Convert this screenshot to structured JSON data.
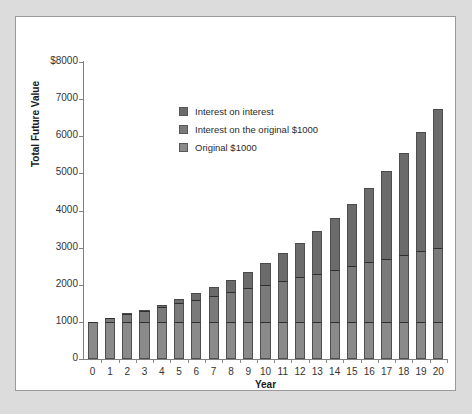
{
  "figure": {
    "background_color": "#dcdcdc",
    "panel_color": "#ffffff",
    "panel_border_color": "#9a9a9a"
  },
  "legend": {
    "position": "inside-top-left",
    "items": [
      {
        "label": "Interest on interest",
        "color": "#6b6b6b",
        "swatch_name": "legend-swatch-interest-on-interest"
      },
      {
        "label": "Interest on the original $1000",
        "color": "#7a7a7a",
        "swatch_name": "legend-swatch-interest-on-original"
      },
      {
        "label": "Original $1000",
        "color": "#8a8a8a",
        "swatch_name": "legend-swatch-original"
      }
    ]
  },
  "chart_data": {
    "type": "bar",
    "stacked": true,
    "title": "",
    "subtitle": "",
    "xlabel": "Year",
    "ylabel": "Total Future Value",
    "grid": false,
    "ylim": [
      0,
      8000
    ],
    "ytick_values": [
      0,
      1000,
      2000,
      3000,
      4000,
      5000,
      6000,
      7000,
      8000
    ],
    "ytick_labels": [
      "0",
      "1000",
      "2000",
      "3000",
      "4000",
      "5000",
      "6000",
      "7000",
      "$8000"
    ],
    "categories": [
      "0",
      "1",
      "2",
      "3",
      "4",
      "5",
      "6",
      "7",
      "8",
      "9",
      "10",
      "11",
      "12",
      "13",
      "14",
      "15",
      "16",
      "17",
      "18",
      "19",
      "20"
    ],
    "xtick_labels": [
      "0",
      "1",
      "2",
      "3",
      "4",
      "5",
      "6",
      "7",
      "8",
      "9",
      "10",
      "11",
      "12",
      "13",
      "14",
      "15",
      "16",
      "17",
      "18",
      "19",
      "20"
    ],
    "series": [
      {
        "name": "Original $1000",
        "color": "#8a8a8a",
        "values": [
          1000,
          1000,
          1000,
          1000,
          1000,
          1000,
          1000,
          1000,
          1000,
          1000,
          1000,
          1000,
          1000,
          1000,
          1000,
          1000,
          1000,
          1000,
          1000,
          1000,
          1000
        ]
      },
      {
        "name": "Interest on the original $1000",
        "color": "#7a7a7a",
        "values": [
          0,
          100,
          200,
          300,
          400,
          500,
          600,
          700,
          800,
          900,
          1000,
          1100,
          1200,
          1300,
          1400,
          1500,
          1600,
          1700,
          1800,
          1900,
          2000
        ]
      },
      {
        "name": "Interest on interest",
        "color": "#6b6b6b",
        "values": [
          0,
          0,
          10,
          31,
          64,
          105,
          172,
          249,
          336,
          436,
          594,
          753,
          938,
          1152,
          1397,
          1677,
          1995,
          2355,
          2760,
          3216,
          3727
        ]
      }
    ],
    "totals": [
      1000,
      1100,
      1210,
      1331,
      1464,
      1605,
      1772,
      1949,
      2136,
      2336,
      2594,
      2853,
      3138,
      3452,
      3797,
      4177,
      4595,
      5055,
      5560,
      6116,
      6727
    ],
    "annual_rate_percent": 10
  }
}
